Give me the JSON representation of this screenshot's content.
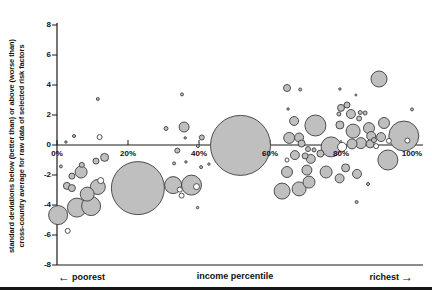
{
  "figure": {
    "y_axis": {
      "title_line1": "standard deviations below (better than) or above (worse than)",
      "title_line2": "cross-country average for raw data of selected risk factors",
      "tick_labels": [
        "8",
        "6",
        "4",
        "2",
        "0",
        "-2",
        "-4",
        "-6",
        "-8"
      ],
      "tick_values": [
        8,
        6,
        4,
        2,
        0,
        -2,
        -4,
        -6,
        -8
      ]
    },
    "x_axis": {
      "tick_labels": [
        "0%",
        "20%",
        "40%",
        "60%",
        "80%",
        "100%"
      ],
      "tick_values": [
        0,
        20,
        40,
        60,
        80,
        100
      ],
      "title": "income percentile",
      "left_annotation": "poorest",
      "right_annotation": "richest",
      "left_arrow_char": "←",
      "right_arrow_char": "→"
    },
    "colors": {
      "bubble_fill": "#bfbfbf",
      "bubble_ring_fill": "#ffffff",
      "bubble_stroke": "#3d3d3d",
      "axis_color": "#1a1a1a",
      "text_color": "#111111"
    }
  },
  "chart_data": {
    "type": "scatter",
    "title": "",
    "xlabel": "income percentile",
    "ylabel": "standard deviations below (better than) or above (worse than) cross-country average for raw data of selected risk factors",
    "x_range": [
      0,
      100
    ],
    "y_range": [
      -8,
      8
    ],
    "x_tick_step": 20,
    "y_tick_step": 2,
    "grid": false,
    "legend": false,
    "note_left": "poorest",
    "note_right": "richest",
    "points": [
      {
        "x": 4.8,
        "y": 0.6,
        "r": 1.5
      },
      {
        "x": 2.5,
        "y": 0.2,
        "r": 1.2
      },
      {
        "x": 11.5,
        "y": 3.07,
        "r": 1.5
      },
      {
        "x": 12.0,
        "y": 0.53,
        "r": 2.5,
        "ring": true
      },
      {
        "x": 1.1,
        "y": -1.43,
        "r": 1.5
      },
      {
        "x": 6.8,
        "y": -1.8,
        "r": 6
      },
      {
        "x": 7.0,
        "y": -1.33,
        "r": 2.5
      },
      {
        "x": 4.2,
        "y": -2.07,
        "r": 3
      },
      {
        "x": 2.8,
        "y": -2.73,
        "r": 3.5
      },
      {
        "x": 4.2,
        "y": -2.87,
        "r": 3.5
      },
      {
        "x": 8.5,
        "y": -3.27,
        "r": 7
      },
      {
        "x": 11.5,
        "y": -2.8,
        "r": 7.5
      },
      {
        "x": 12.3,
        "y": -2.37,
        "r": 3,
        "ring": true
      },
      {
        "x": 0.3,
        "y": -4.67,
        "r": 9.5
      },
      {
        "x": 5.6,
        "y": -4.17,
        "r": 9.5
      },
      {
        "x": 9.6,
        "y": -4.07,
        "r": 9.5
      },
      {
        "x": 3.0,
        "y": -5.73,
        "r": 2.5,
        "ring": true
      },
      {
        "x": 11.0,
        "y": -1.07,
        "r": 3
      },
      {
        "x": 13.4,
        "y": -0.83,
        "r": 4
      },
      {
        "x": 22.8,
        "y": -2.87,
        "r": 26.5
      },
      {
        "x": 30.7,
        "y": 1.1,
        "r": 2
      },
      {
        "x": 35.8,
        "y": 1.2,
        "r": 5
      },
      {
        "x": 35.2,
        "y": 3.37,
        "r": 1.5
      },
      {
        "x": 36.1,
        "y": 0.47,
        "r": 1.2
      },
      {
        "x": 40.8,
        "y": 0.5,
        "r": 2.5
      },
      {
        "x": 39.7,
        "y": -0.07,
        "r": 1.5
      },
      {
        "x": 33.9,
        "y": -0.37,
        "r": 2.5
      },
      {
        "x": 33.0,
        "y": -1.23,
        "r": 1.5
      },
      {
        "x": 36.3,
        "y": -1.13,
        "r": 1.2
      },
      {
        "x": 40.6,
        "y": -1.47,
        "r": 1.5
      },
      {
        "x": 42.8,
        "y": -1.27,
        "r": 1.2
      },
      {
        "x": 32.7,
        "y": -2.67,
        "r": 8.5
      },
      {
        "x": 37.9,
        "y": -2.67,
        "r": 10
      },
      {
        "x": 39.3,
        "y": -2.77,
        "r": 3,
        "ring": true
      },
      {
        "x": 34.6,
        "y": -2.97,
        "r": 2.5,
        "ring": true
      },
      {
        "x": 35.1,
        "y": -3.37,
        "r": 2.5,
        "ring": true
      },
      {
        "x": 39.6,
        "y": -4.17,
        "r": 1.2
      },
      {
        "x": 51.7,
        "y": -0.03,
        "r": 30
      },
      {
        "x": 64.8,
        "y": 3.8,
        "r": 3.5
      },
      {
        "x": 68.5,
        "y": 3.7,
        "r": 1.5
      },
      {
        "x": 65.1,
        "y": 2.4,
        "r": 1.2
      },
      {
        "x": 66.8,
        "y": 1.6,
        "r": 4.5
      },
      {
        "x": 65.4,
        "y": 0.47,
        "r": 5.5
      },
      {
        "x": 68.2,
        "y": 0.5,
        "r": 4.5
      },
      {
        "x": 68.9,
        "y": 0.1,
        "r": 3.5
      },
      {
        "x": 64.8,
        "y": -1.8,
        "r": 5.5
      },
      {
        "x": 63.4,
        "y": -3.07,
        "r": 8
      },
      {
        "x": 68.2,
        "y": -2.93,
        "r": 7
      },
      {
        "x": 64.8,
        "y": -1.0,
        "r": 2,
        "ring": true
      },
      {
        "x": 67.0,
        "y": -0.67,
        "r": 4.5
      },
      {
        "x": 69.9,
        "y": -0.73,
        "r": 3
      },
      {
        "x": 71.5,
        "y": -0.93,
        "r": 4.5
      },
      {
        "x": 70.4,
        "y": -1.67,
        "r": 5
      },
      {
        "x": 71.0,
        "y": -2.47,
        "r": 6
      },
      {
        "x": 70.7,
        "y": -0.27,
        "r": 2.5
      },
      {
        "x": 72.4,
        "y": -0.33,
        "r": 2
      },
      {
        "x": 74.2,
        "y": -0.57,
        "r": 3.5
      },
      {
        "x": 75.8,
        "y": -1.8,
        "r": 6
      },
      {
        "x": 79.6,
        "y": -2.23,
        "r": 4.5
      },
      {
        "x": 81.3,
        "y": -1.53,
        "r": 4
      },
      {
        "x": 84.5,
        "y": -1.93,
        "r": 4.5
      },
      {
        "x": 87.6,
        "y": -2.6,
        "r": 1.5
      },
      {
        "x": 84.4,
        "y": -3.8,
        "r": 1.5
      },
      {
        "x": 93.2,
        "y": -1.0,
        "r": 10
      },
      {
        "x": 72.8,
        "y": 1.3,
        "r": 10.5
      },
      {
        "x": 79.7,
        "y": 1.33,
        "r": 4
      },
      {
        "x": 83.4,
        "y": 0.93,
        "r": 7
      },
      {
        "x": 87.9,
        "y": 1.13,
        "r": 5.5
      },
      {
        "x": 92.1,
        "y": 1.47,
        "r": 5.5
      },
      {
        "x": 88.5,
        "y": 0.6,
        "r": 4.5
      },
      {
        "x": 91.3,
        "y": 0.53,
        "r": 4.5
      },
      {
        "x": 93.5,
        "y": 0.27,
        "r": 2.5,
        "ring": true
      },
      {
        "x": 97.7,
        "y": 0.6,
        "r": 15
      },
      {
        "x": 98.7,
        "y": 0.3,
        "r": 2.5,
        "ring": true
      },
      {
        "x": 77.2,
        "y": -0.13,
        "r": 10
      },
      {
        "x": 80.3,
        "y": -0.13,
        "r": 4.5,
        "ring": true
      },
      {
        "x": 83.1,
        "y": 0.07,
        "r": 5
      },
      {
        "x": 85.6,
        "y": 0.13,
        "r": 5.5
      },
      {
        "x": 88.2,
        "y": 0.07,
        "r": 4
      },
      {
        "x": 89.9,
        "y": -0.07,
        "r": 2.5,
        "ring": true
      },
      {
        "x": 89.3,
        "y": 0.33,
        "r": 2.5
      },
      {
        "x": 80.0,
        "y": 2.47,
        "r": 3.5
      },
      {
        "x": 81.7,
        "y": 2.67,
        "r": 3
      },
      {
        "x": 79.4,
        "y": 2.07,
        "r": 2
      },
      {
        "x": 82.8,
        "y": 2.07,
        "r": 4.5
      },
      {
        "x": 85.4,
        "y": 2.17,
        "r": 2
      },
      {
        "x": 86.8,
        "y": 2.13,
        "r": 2
      },
      {
        "x": 85.1,
        "y": 1.77,
        "r": 2.5
      },
      {
        "x": 79.7,
        "y": 3.73,
        "r": 1.2
      },
      {
        "x": 84.2,
        "y": 3.33,
        "r": 1
      },
      {
        "x": 90.7,
        "y": 4.4,
        "r": 8
      },
      {
        "x": 100.0,
        "y": 2.37,
        "r": 1.5
      }
    ]
  }
}
